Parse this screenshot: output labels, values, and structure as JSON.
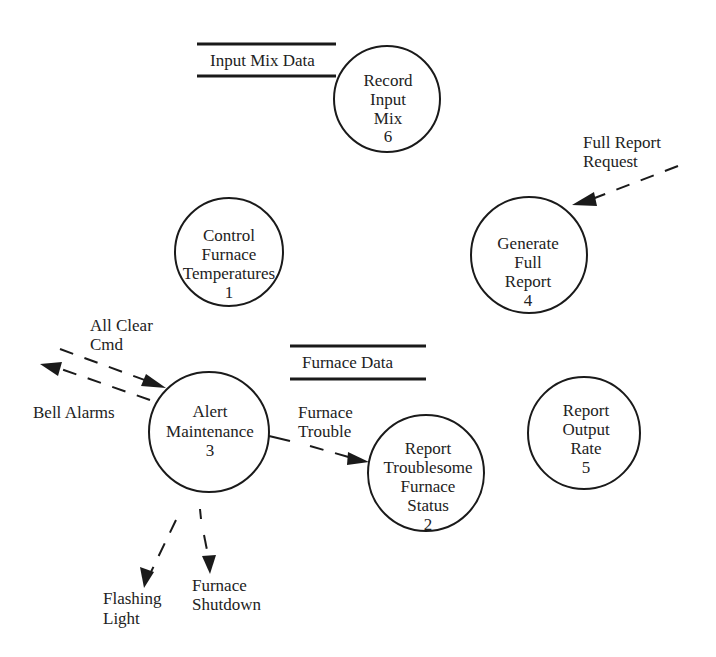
{
  "diagram": {
    "type": "data-flow-diagram",
    "processes": [
      {
        "id": "p6",
        "lines": [
          "Record",
          "Input",
          "Mix",
          "6"
        ]
      },
      {
        "id": "p1",
        "lines": [
          "Control",
          "Furnace",
          "Temperatures",
          "1"
        ]
      },
      {
        "id": "p4",
        "lines": [
          "Generate",
          "Full",
          "Report",
          "4"
        ]
      },
      {
        "id": "p3",
        "lines": [
          "Alert",
          "Maintenance",
          "3"
        ]
      },
      {
        "id": "p2",
        "lines": [
          "Report",
          "Troublesome",
          "Furnace",
          "Status",
          "2"
        ]
      },
      {
        "id": "p5",
        "lines": [
          "Report",
          "Output",
          "Rate",
          "5"
        ]
      }
    ],
    "data_stores": [
      {
        "id": "ds_input_mix",
        "label": "Input Mix Data"
      },
      {
        "id": "ds_furnace",
        "label": "Furnace Data"
      }
    ],
    "flows": [
      {
        "id": "f_full_report_request",
        "lines": [
          "Full Report",
          "Request"
        ],
        "to": "Generate Full Report 4",
        "style": "dashed"
      },
      {
        "id": "f_all_clear_cmd",
        "lines": [
          "All Clear",
          "Cmd"
        ],
        "to": "Alert Maintenance 3",
        "style": "dashed"
      },
      {
        "id": "f_bell_alarms",
        "lines": [
          "Bell Alarms"
        ],
        "from": "Alert Maintenance 3",
        "style": "dashed"
      },
      {
        "id": "f_furnace_trouble",
        "lines": [
          "Furnace",
          "Trouble"
        ],
        "from": "Alert Maintenance 3",
        "to": "Report Troublesome Furnace Status 2",
        "style": "dashed"
      },
      {
        "id": "f_flashing_light",
        "lines": [
          "Flashing",
          "Light"
        ],
        "from": "Alert Maintenance 3",
        "style": "dashed"
      },
      {
        "id": "f_furnace_shutdown",
        "lines": [
          "Furnace",
          "Shutdown"
        ],
        "from": "Alert Maintenance 3",
        "style": "dashed"
      }
    ]
  }
}
